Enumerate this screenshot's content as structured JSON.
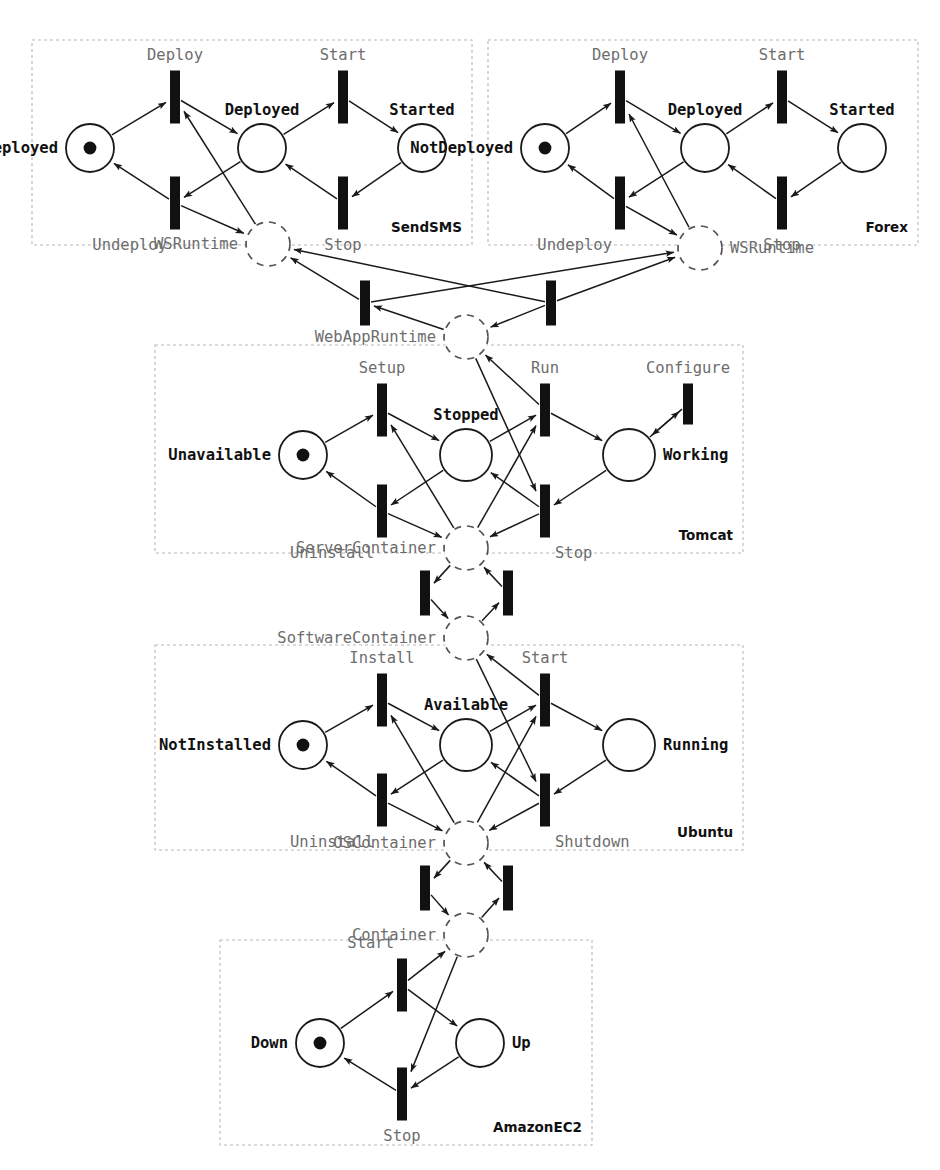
{
  "diagram": {
    "kind": "petri-net",
    "title": "",
    "colors": {
      "place_stroke": "#1a1a1a",
      "virtual_place_stroke": "#555555",
      "transition_fill": "#111111",
      "arc": "#1a1a1a",
      "panel_border": "#b8b8b8",
      "transition_label": "#6d6d6d",
      "place_label": "#111111"
    }
  },
  "panels": [
    {
      "id": "sendsms",
      "label": "SendSMS",
      "x": 32,
      "y": 40,
      "w": 440,
      "h": 205
    },
    {
      "id": "forex",
      "label": "Forex",
      "x": 488,
      "y": 40,
      "w": 430,
      "h": 205
    },
    {
      "id": "tomcat",
      "label": "Tomcat",
      "x": 155,
      "y": 345,
      "w": 588,
      "h": 208
    },
    {
      "id": "ubuntu",
      "label": "Ubuntu",
      "x": 155,
      "y": 645,
      "w": 588,
      "h": 205
    },
    {
      "id": "amazonec2",
      "label": "AmazonEC2",
      "x": 220,
      "y": 940,
      "w": 372,
      "h": 205
    }
  ],
  "places": [
    {
      "id": "sms_notdeployed",
      "label": "NotDeployed",
      "x": 90,
      "y": 148,
      "r": 24,
      "token": true,
      "virtual": false,
      "label_pos": "left"
    },
    {
      "id": "sms_deployed",
      "label": "Deployed",
      "x": 262,
      "y": 148,
      "r": 24,
      "token": false,
      "virtual": false,
      "label_pos": "above"
    },
    {
      "id": "sms_started",
      "label": "Started",
      "x": 422,
      "y": 148,
      "r": 24,
      "token": false,
      "virtual": false,
      "label_pos": "above"
    },
    {
      "id": "sms_wsruntime",
      "label": "WSRuntime",
      "x": 268,
      "y": 244,
      "r": 22,
      "token": false,
      "virtual": true,
      "label_pos": "left"
    },
    {
      "id": "fx_notdeployed",
      "label": "NotDeployed",
      "x": 545,
      "y": 148,
      "r": 24,
      "token": true,
      "virtual": false,
      "label_pos": "left"
    },
    {
      "id": "fx_deployed",
      "label": "Deployed",
      "x": 705,
      "y": 148,
      "r": 24,
      "token": false,
      "virtual": false,
      "label_pos": "above"
    },
    {
      "id": "fx_started",
      "label": "Started",
      "x": 862,
      "y": 148,
      "r": 24,
      "token": false,
      "virtual": false,
      "label_pos": "above"
    },
    {
      "id": "fx_wsruntime",
      "label": "WSRuntime",
      "x": 700,
      "y": 248,
      "r": 22,
      "token": false,
      "virtual": true,
      "label_pos": "right"
    },
    {
      "id": "webappruntime",
      "label": "WebAppRuntime",
      "x": 466,
      "y": 337,
      "r": 22,
      "token": false,
      "virtual": true,
      "label_pos": "left"
    },
    {
      "id": "tc_unavailable",
      "label": "Unavailable",
      "x": 303,
      "y": 455,
      "r": 24,
      "token": true,
      "virtual": false,
      "label_pos": "left"
    },
    {
      "id": "tc_stopped",
      "label": "Stopped",
      "x": 466,
      "y": 455,
      "r": 26,
      "token": false,
      "virtual": false,
      "label_pos": "above"
    },
    {
      "id": "tc_working",
      "label": "Working",
      "x": 629,
      "y": 455,
      "r": 26,
      "token": false,
      "virtual": false,
      "label_pos": "right"
    },
    {
      "id": "servercontainer",
      "label": "ServerContainer",
      "x": 466,
      "y": 548,
      "r": 22,
      "token": false,
      "virtual": true,
      "label_pos": "left"
    },
    {
      "id": "softwarecontainer",
      "label": "SoftwareContainer",
      "x": 466,
      "y": 638,
      "r": 22,
      "token": false,
      "virtual": true,
      "label_pos": "left"
    },
    {
      "id": "ub_notinstalled",
      "label": "NotInstalled",
      "x": 303,
      "y": 745,
      "r": 24,
      "token": true,
      "virtual": false,
      "label_pos": "left"
    },
    {
      "id": "ub_available",
      "label": "Available",
      "x": 466,
      "y": 745,
      "r": 26,
      "token": false,
      "virtual": false,
      "label_pos": "above"
    },
    {
      "id": "ub_running",
      "label": "Running",
      "x": 629,
      "y": 745,
      "r": 26,
      "token": false,
      "virtual": false,
      "label_pos": "right"
    },
    {
      "id": "oscontainer",
      "label": "OSContainer",
      "x": 466,
      "y": 843,
      "r": 22,
      "token": false,
      "virtual": true,
      "label_pos": "left"
    },
    {
      "id": "container",
      "label": "Container",
      "x": 466,
      "y": 935,
      "r": 22,
      "token": false,
      "virtual": true,
      "label_pos": "left"
    },
    {
      "id": "ec2_down",
      "label": "Down",
      "x": 320,
      "y": 1043,
      "r": 24,
      "token": true,
      "virtual": false,
      "label_pos": "left"
    },
    {
      "id": "ec2_up",
      "label": "Up",
      "x": 480,
      "y": 1043,
      "r": 24,
      "token": false,
      "virtual": false,
      "label_pos": "right"
    }
  ],
  "transitions": [
    {
      "id": "sms_deploy",
      "label": "Deploy",
      "x": 175,
      "y": 97,
      "w": 9,
      "h": 52,
      "label_pos": "above"
    },
    {
      "id": "sms_start",
      "label": "Start",
      "x": 343,
      "y": 97,
      "w": 9,
      "h": 52,
      "label_pos": "above"
    },
    {
      "id": "sms_undeploy",
      "label": "Undeploy",
      "x": 175,
      "y": 203,
      "w": 9,
      "h": 52,
      "label_pos": "below-left"
    },
    {
      "id": "sms_stop",
      "label": "Stop",
      "x": 343,
      "y": 203,
      "w": 9,
      "h": 52,
      "label_pos": "below"
    },
    {
      "id": "fx_deploy",
      "label": "Deploy",
      "x": 620,
      "y": 97,
      "w": 9,
      "h": 52,
      "label_pos": "above"
    },
    {
      "id": "fx_start",
      "label": "Start",
      "x": 782,
      "y": 97,
      "w": 9,
      "h": 52,
      "label_pos": "above"
    },
    {
      "id": "fx_undeploy",
      "label": "Undeploy",
      "x": 620,
      "y": 203,
      "w": 9,
      "h": 52,
      "label_pos": "below-left"
    },
    {
      "id": "fx_stop",
      "label": "Stop",
      "x": 782,
      "y": 203,
      "w": 9,
      "h": 52,
      "label_pos": "below"
    },
    {
      "id": "war_left",
      "label": "",
      "x": 365,
      "y": 303,
      "w": 9,
      "h": 44,
      "label_pos": "none"
    },
    {
      "id": "war_right",
      "label": "",
      "x": 551,
      "y": 303,
      "w": 9,
      "h": 44,
      "label_pos": "none"
    },
    {
      "id": "tc_setup",
      "label": "Setup",
      "x": 382,
      "y": 410,
      "w": 9,
      "h": 52,
      "label_pos": "above"
    },
    {
      "id": "tc_run",
      "label": "Run",
      "x": 545,
      "y": 410,
      "w": 9,
      "h": 52,
      "label_pos": "above"
    },
    {
      "id": "tc_configure",
      "label": "Configure",
      "x": 688,
      "y": 404,
      "w": 9,
      "h": 40,
      "label_pos": "above"
    },
    {
      "id": "tc_uninstall",
      "label": "Uninstall",
      "x": 382,
      "y": 511,
      "w": 9,
      "h": 52,
      "label_pos": "below-left"
    },
    {
      "id": "tc_stop",
      "label": "Stop",
      "x": 545,
      "y": 511,
      "w": 9,
      "h": 52,
      "label_pos": "below-right"
    },
    {
      "id": "sc_left",
      "label": "",
      "x": 425,
      "y": 593,
      "w": 9,
      "h": 44,
      "label_pos": "none"
    },
    {
      "id": "sc_right",
      "label": "",
      "x": 508,
      "y": 593,
      "w": 9,
      "h": 44,
      "label_pos": "none"
    },
    {
      "id": "ub_install",
      "label": "Install",
      "x": 382,
      "y": 700,
      "w": 9,
      "h": 52,
      "label_pos": "above"
    },
    {
      "id": "ub_start",
      "label": "Start",
      "x": 545,
      "y": 700,
      "w": 9,
      "h": 52,
      "label_pos": "above"
    },
    {
      "id": "ub_uninstall",
      "label": "Uninstall",
      "x": 382,
      "y": 800,
      "w": 9,
      "h": 52,
      "label_pos": "below-left"
    },
    {
      "id": "ub_shutdown",
      "label": "Shutdown",
      "x": 545,
      "y": 800,
      "w": 9,
      "h": 52,
      "label_pos": "below-right"
    },
    {
      "id": "oc_left",
      "label": "",
      "x": 425,
      "y": 888,
      "w": 9,
      "h": 44,
      "label_pos": "none"
    },
    {
      "id": "oc_right",
      "label": "",
      "x": 508,
      "y": 888,
      "w": 9,
      "h": 44,
      "label_pos": "none"
    },
    {
      "id": "ec2_start",
      "label": "Start",
      "x": 402,
      "y": 985,
      "w": 9,
      "h": 52,
      "label_pos": "above-left"
    },
    {
      "id": "ec2_stop",
      "label": "Stop",
      "x": 402,
      "y": 1094,
      "w": 9,
      "h": 52,
      "label_pos": "below"
    }
  ],
  "arcs": [
    {
      "from": "sms_notdeployed",
      "to": "sms_deploy"
    },
    {
      "from": "sms_deploy",
      "to": "sms_deployed"
    },
    {
      "from": "sms_deployed",
      "to": "sms_start"
    },
    {
      "from": "sms_start",
      "to": "sms_started"
    },
    {
      "from": "sms_started",
      "to": "sms_stop"
    },
    {
      "from": "sms_stop",
      "to": "sms_deployed"
    },
    {
      "from": "sms_deployed",
      "to": "sms_undeploy"
    },
    {
      "from": "sms_undeploy",
      "to": "sms_notdeployed"
    },
    {
      "from": "sms_wsruntime",
      "to": "sms_deploy"
    },
    {
      "from": "sms_undeploy",
      "to": "sms_wsruntime"
    },
    {
      "from": "fx_notdeployed",
      "to": "fx_deploy"
    },
    {
      "from": "fx_deploy",
      "to": "fx_deployed"
    },
    {
      "from": "fx_deployed",
      "to": "fx_start"
    },
    {
      "from": "fx_start",
      "to": "fx_started"
    },
    {
      "from": "fx_started",
      "to": "fx_stop"
    },
    {
      "from": "fx_stop",
      "to": "fx_deployed"
    },
    {
      "from": "fx_deployed",
      "to": "fx_undeploy"
    },
    {
      "from": "fx_undeploy",
      "to": "fx_notdeployed"
    },
    {
      "from": "fx_wsruntime",
      "to": "fx_deploy"
    },
    {
      "from": "fx_undeploy",
      "to": "fx_wsruntime"
    },
    {
      "from": "war_left",
      "to": "sms_wsruntime"
    },
    {
      "from": "war_left",
      "to": "fx_wsruntime"
    },
    {
      "from": "war_right",
      "to": "sms_wsruntime"
    },
    {
      "from": "war_right",
      "to": "fx_wsruntime"
    },
    {
      "from": "webappruntime",
      "to": "war_left"
    },
    {
      "from": "war_right",
      "to": "webappruntime"
    },
    {
      "from": "tc_unavailable",
      "to": "tc_setup"
    },
    {
      "from": "tc_setup",
      "to": "tc_stopped"
    },
    {
      "from": "tc_stopped",
      "to": "tc_run"
    },
    {
      "from": "tc_run",
      "to": "tc_working"
    },
    {
      "from": "tc_working",
      "to": "tc_configure"
    },
    {
      "from": "tc_configure",
      "to": "tc_working"
    },
    {
      "from": "tc_working",
      "to": "tc_stop"
    },
    {
      "from": "tc_stop",
      "to": "tc_stopped"
    },
    {
      "from": "tc_stopped",
      "to": "tc_uninstall"
    },
    {
      "from": "tc_uninstall",
      "to": "tc_unavailable"
    },
    {
      "from": "servercontainer",
      "to": "tc_setup"
    },
    {
      "from": "tc_uninstall",
      "to": "servercontainer"
    },
    {
      "from": "webappruntime",
      "to": "tc_stop"
    },
    {
      "from": "tc_run",
      "to": "webappruntime"
    },
    {
      "from": "tc_stop",
      "to": "servercontainer"
    },
    {
      "from": "servercontainer",
      "to": "tc_run"
    },
    {
      "from": "servercontainer",
      "to": "sc_left"
    },
    {
      "from": "sc_left",
      "to": "softwarecontainer"
    },
    {
      "from": "softwarecontainer",
      "to": "sc_right"
    },
    {
      "from": "sc_right",
      "to": "servercontainer"
    },
    {
      "from": "ub_notinstalled",
      "to": "ub_install"
    },
    {
      "from": "ub_install",
      "to": "ub_available"
    },
    {
      "from": "ub_available",
      "to": "ub_start"
    },
    {
      "from": "ub_start",
      "to": "ub_running"
    },
    {
      "from": "ub_running",
      "to": "ub_shutdown"
    },
    {
      "from": "ub_shutdown",
      "to": "ub_available"
    },
    {
      "from": "ub_available",
      "to": "ub_uninstall"
    },
    {
      "from": "ub_uninstall",
      "to": "ub_notinstalled"
    },
    {
      "from": "oscontainer",
      "to": "ub_install"
    },
    {
      "from": "ub_uninstall",
      "to": "oscontainer"
    },
    {
      "from": "softwarecontainer",
      "to": "ub_shutdown"
    },
    {
      "from": "ub_start",
      "to": "softwarecontainer"
    },
    {
      "from": "ub_shutdown",
      "to": "oscontainer"
    },
    {
      "from": "oscontainer",
      "to": "ub_start"
    },
    {
      "from": "oscontainer",
      "to": "oc_left"
    },
    {
      "from": "oc_left",
      "to": "container"
    },
    {
      "from": "container",
      "to": "oc_right"
    },
    {
      "from": "oc_right",
      "to": "oscontainer"
    },
    {
      "from": "ec2_down",
      "to": "ec2_start"
    },
    {
      "from": "ec2_start",
      "to": "ec2_up"
    },
    {
      "from": "ec2_up",
      "to": "ec2_stop"
    },
    {
      "from": "ec2_stop",
      "to": "ec2_down"
    },
    {
      "from": "ec2_start",
      "to": "container"
    },
    {
      "from": "container",
      "to": "ec2_stop"
    }
  ]
}
